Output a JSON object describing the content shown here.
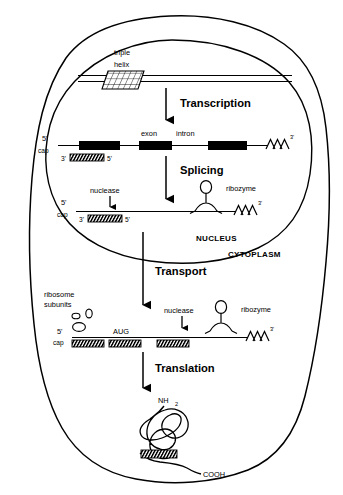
{
  "figure": {
    "type": "biology-schematic",
    "background_color": "#ffffff",
    "ink_color": "#000000"
  },
  "compartments": {
    "nucleus_label": "NUCLEUS",
    "cytoplasm_label": "CYTOPLASM"
  },
  "steps": {
    "transcription": "Transcription",
    "splicing": "Splicing",
    "transport": "Transport",
    "translation": "Translation"
  },
  "dna": {
    "triple_label_line1": "triple",
    "triple_label_line2": "helix"
  },
  "pre_mrna": {
    "five_prime": "5'",
    "cap": "cap",
    "exon_label": "exon",
    "intron_label": "intron",
    "poly_a": "AAA",
    "three_prime_sup": "3'",
    "oligo_three_prime": "3'",
    "oligo_five_prime": "5'"
  },
  "spliced_mrna": {
    "five_prime": "5'",
    "cap": "cap",
    "nuclease_label": "nuclease",
    "ribozyme_label": "ribozyme",
    "poly_a": "AAA",
    "three_prime_sup": "3'",
    "oligo_three_prime": "3'",
    "oligo_five_prime": "5'"
  },
  "cytoplasmic_mrna": {
    "ribosome_line1": "ribosome",
    "ribosome_line2": "subunits",
    "five_prime": "5'",
    "cap": "cap",
    "start_codon": "AUG",
    "nuclease_label": "nuclease",
    "ribozyme_label": "ribozyme",
    "poly_a": "AAA",
    "three_prime_sup": "3'"
  },
  "protein": {
    "n_terminus": "NH",
    "n_terminus_sub": "2",
    "c_terminus": "COOH"
  }
}
